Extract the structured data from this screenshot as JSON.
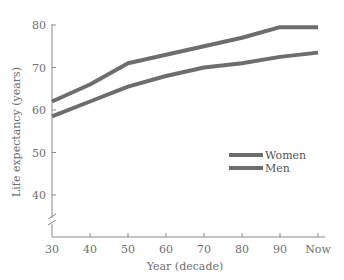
{
  "chart_data": {
    "type": "line",
    "title": "",
    "xlabel": "Year (decade)",
    "ylabel": "Life expectancy (years)",
    "categories": [
      "30",
      "40",
      "50",
      "60",
      "70",
      "80",
      "90",
      "Now"
    ],
    "series": [
      {
        "name": "Women",
        "values": [
          62,
          66,
          71,
          73,
          75,
          77,
          79.5,
          79.5
        ]
      },
      {
        "name": "Men",
        "values": [
          58.5,
          62,
          65.5,
          68,
          70,
          71,
          72.5,
          73.5
        ]
      }
    ],
    "yticks": [
      40,
      50,
      60,
      70,
      80
    ],
    "ylim": [
      32,
      80
    ],
    "y_axis_break": true,
    "grid": false,
    "legend_position": "right-center",
    "colors": {
      "line": "#6d6d6d",
      "axis": "#8a8a8a",
      "text": "#6f6f6f"
    }
  }
}
